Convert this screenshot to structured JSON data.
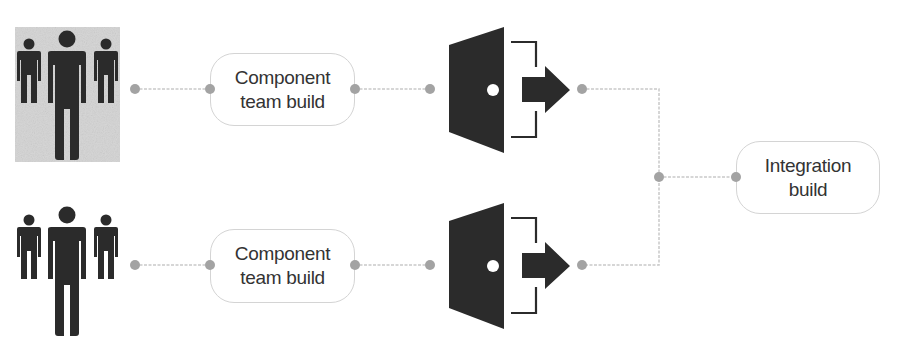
{
  "diagram": {
    "teams": [
      {
        "id": "team-1",
        "label_line1": "Component",
        "label_line2": "team build",
        "highlighted": true
      },
      {
        "id": "team-2",
        "label_line1": "Component",
        "label_line2": "team build",
        "highlighted": false
      }
    ],
    "integration": {
      "label_line1": "Integration",
      "label_line2": "build"
    },
    "icons": {
      "people": "team-people-icon",
      "exit": "door-exit-icon"
    },
    "colors": {
      "icon": "#2b2b2b",
      "connector": "#c9c9c9",
      "dot": "#a3a3a3",
      "text": "#333333",
      "highlight_bg": "#d4d4d4"
    }
  }
}
